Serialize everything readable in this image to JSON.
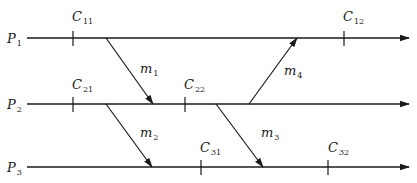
{
  "diagram": {
    "type": "space-time diagram",
    "processes": [
      {
        "id": "P1",
        "name": "P",
        "sub": "1",
        "y": 38,
        "x_start": 27,
        "x_end": 409
      },
      {
        "id": "P2",
        "name": "P",
        "sub": "2",
        "y": 104,
        "x_start": 27,
        "x_end": 409
      },
      {
        "id": "P3",
        "name": "P",
        "sub": "3",
        "y": 167,
        "x_start": 27,
        "x_end": 409
      }
    ],
    "checkpoints": [
      {
        "id": "C11",
        "name": "C",
        "sub": "11",
        "process": "P1",
        "x": 73
      },
      {
        "id": "C12",
        "name": "C",
        "sub": "12",
        "process": "P1",
        "x": 344
      },
      {
        "id": "C21",
        "name": "C",
        "sub": "21",
        "process": "P2",
        "x": 73
      },
      {
        "id": "C22",
        "name": "C",
        "sub": "22",
        "process": "P2",
        "x": 185
      },
      {
        "id": "C31",
        "name": "C",
        "sub": "31",
        "process": "P3",
        "x": 201
      },
      {
        "id": "C32",
        "name": "C",
        "sub": "32",
        "process": "P3",
        "x": 328
      }
    ],
    "messages": [
      {
        "id": "m1",
        "name": "m",
        "sub": "1",
        "from": "P1",
        "to": "P2",
        "x1": 106,
        "y1": 38,
        "x2": 153,
        "y2": 104,
        "label_x": 140,
        "label_y": 62
      },
      {
        "id": "m2",
        "name": "m",
        "sub": "2",
        "from": "P2",
        "to": "P3",
        "x1": 106,
        "y1": 104,
        "x2": 152,
        "y2": 167,
        "label_x": 140,
        "label_y": 126
      },
      {
        "id": "m3",
        "name": "m",
        "sub": "3",
        "from": "P2",
        "to": "P3",
        "x1": 216,
        "y1": 104,
        "x2": 263,
        "y2": 167,
        "label_x": 260,
        "label_y": 126
      },
      {
        "id": "m4",
        "name": "m",
        "sub": "4",
        "from": "P2",
        "to": "P1",
        "x1": 249,
        "y1": 104,
        "x2": 297,
        "y2": 38,
        "label_x": 283,
        "label_y": 64
      }
    ]
  },
  "labels": {
    "P1": {
      "name": "P",
      "sub": "1"
    },
    "P2": {
      "name": "P",
      "sub": "2"
    },
    "P3": {
      "name": "P",
      "sub": "3"
    },
    "C11": {
      "name": "C",
      "sub": "11"
    },
    "C12": {
      "name": "C",
      "sub": "12"
    },
    "C21": {
      "name": "C",
      "sub": "21"
    },
    "C22": {
      "name": "C",
      "sub": "22"
    },
    "C31": {
      "name": "C",
      "sub": "31"
    },
    "C32": {
      "name": "C",
      "sub": "32"
    },
    "m1": {
      "name": "m",
      "sub": "1"
    },
    "m2": {
      "name": "m",
      "sub": "2"
    },
    "m3": {
      "name": "m",
      "sub": "3"
    },
    "m4": {
      "name": "m",
      "sub": "4"
    }
  },
  "colors": {
    "line": "#1a1a1a",
    "background": "#ffffff"
  }
}
